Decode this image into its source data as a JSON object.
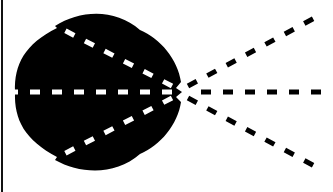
{
  "diagram": {
    "colors": {
      "background": "#ffffff",
      "lobe": "#000000",
      "inner_lines": "#ffffff",
      "outer_lines": "#000000",
      "border": "#111111"
    },
    "origin": {
      "x": 180,
      "y": 92
    },
    "lobe": {
      "shape": "cardioid-like blob",
      "left_extent": 15,
      "right_extent": 183,
      "top": 14,
      "bottom": 170
    },
    "inner_lines": [
      {
        "name": "inner-line-upper",
        "to": {
          "x": 55,
          "y": 24
        }
      },
      {
        "name": "inner-line-center",
        "to": {
          "x": 15,
          "y": 92
        }
      },
      {
        "name": "inner-line-lower",
        "to": {
          "x": 55,
          "y": 162
        }
      }
    ],
    "outer_lines": [
      {
        "name": "outer-line-upper",
        "to": {
          "x": 322,
          "y": 14
        }
      },
      {
        "name": "outer-line-center",
        "to": {
          "x": 333,
          "y": 92
        }
      },
      {
        "name": "outer-line-lower",
        "to": {
          "x": 322,
          "y": 170
        }
      }
    ]
  }
}
